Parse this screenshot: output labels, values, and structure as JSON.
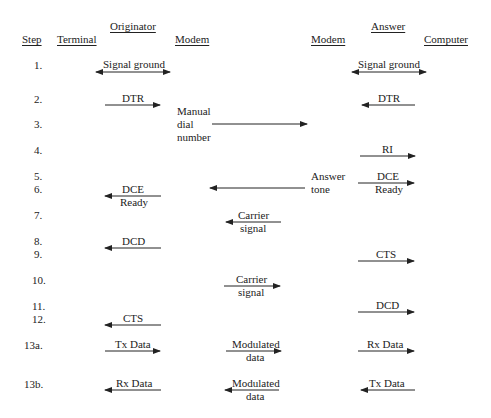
{
  "headers": {
    "originator": "Originator",
    "answer": "Answer",
    "step": "Step",
    "terminal": "Terminal",
    "modem_left": "Modem",
    "modem_right": "Modem",
    "computer": "Computer"
  },
  "steps": [
    "1.",
    "2.",
    "3.",
    "4.",
    "5.",
    "6.",
    "7.",
    "8.",
    "9.",
    "10.",
    "11.",
    "12.",
    "13a.",
    "13b."
  ],
  "labels": {
    "s1_left": "Signal ground",
    "s1_right": "Signal ground",
    "s2_left": "DTR",
    "s2_right": "DTR",
    "s3_manual_1": "Manual",
    "s3_manual_2": "dial",
    "s3_manual_3": "number",
    "s4_right": "RI",
    "s5_answer_1": "Answer",
    "s5_answer_2": "tone",
    "s5_right_1": "DCE",
    "s5_right_2": "Ready",
    "s6_left_1": "DCE",
    "s6_left_2": "Ready",
    "s7_mid_1": "Carrier",
    "s7_mid_2": "signal",
    "s8_left": "DCD",
    "s9_right": "CTS",
    "s10_mid_1": "Carrier",
    "s10_mid_2": "signal",
    "s11_right": "DCD",
    "s12_left": "CTS",
    "s13a_left": "Tx Data",
    "s13a_mid_1": "Modulated",
    "s13a_mid_2": "data",
    "s13a_right": "Rx Data",
    "s13b_left": "Rx Data",
    "s13b_mid_1": "Modulated",
    "s13b_mid_2": "data",
    "s13b_right": "Tx Data"
  },
  "colors": {
    "ink": "#222222",
    "background": "#ffffff"
  }
}
